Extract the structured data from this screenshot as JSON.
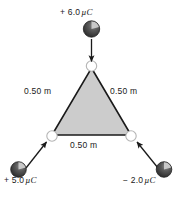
{
  "figure": {
    "background_color": "#ffffff",
    "triangle": {
      "fill_color": "#cccccc",
      "edge_color": "#1a1a1a",
      "vertex_marker": "open-circle",
      "side_length_label": "0.50 m"
    },
    "sides": [
      {
        "id": "left",
        "label": "0.50 m"
      },
      {
        "id": "right",
        "label": "0.50 m"
      },
      {
        "id": "bottom",
        "label": "0.50 m"
      }
    ],
    "charges": [
      {
        "id": "top",
        "label": "+ 6.0",
        "unit": "µC",
        "sign": "+",
        "magnitude": "6.0",
        "arrow_direction": "down"
      },
      {
        "id": "bottom-left",
        "label": "+ 5.0",
        "unit": "µC",
        "sign": "+",
        "magnitude": "5.0",
        "arrow_direction": "up-right"
      },
      {
        "id": "bottom-right",
        "label": "− 2.0",
        "unit": "µC",
        "sign": "−",
        "magnitude": "2.0",
        "arrow_direction": "up-left"
      }
    ],
    "sphere": {
      "body_color": "#4d4d4d",
      "shade_color": "#2b2b2b",
      "highlight_color": "#e8e8e8"
    }
  }
}
